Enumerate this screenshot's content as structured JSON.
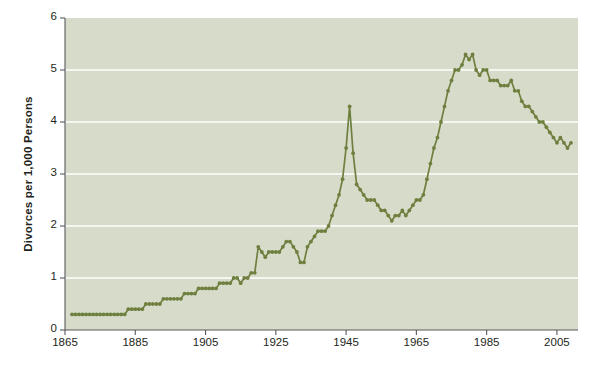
{
  "chart_data": {
    "type": "line",
    "title": "",
    "subtitle": "",
    "xlabel": "",
    "ylabel": "Divorces per 1,000 Persons",
    "xlim": [
      1865,
      2011
    ],
    "ylim": [
      0,
      6
    ],
    "xticks": [
      1865,
      1885,
      1905,
      1925,
      1945,
      1965,
      1985,
      2005
    ],
    "yticks": [
      0,
      1,
      2,
      3,
      4,
      5,
      6
    ],
    "grid": "horizontal",
    "legend": "none",
    "marker": "circle",
    "line_color": "#6f7f3f",
    "marker_color": "#6f7f3f",
    "plot_background": "#d6dcc9",
    "grid_color": "#ffffff",
    "figure_background": "#ffffff",
    "axis_color": "#58595b",
    "text_color": "#231f20",
    "annotations": [],
    "series": [
      {
        "name": "Divorces per 1,000 Persons",
        "x": [
          1867,
          1868,
          1869,
          1870,
          1871,
          1872,
          1873,
          1874,
          1875,
          1876,
          1877,
          1878,
          1879,
          1880,
          1881,
          1882,
          1883,
          1884,
          1885,
          1886,
          1887,
          1888,
          1889,
          1890,
          1891,
          1892,
          1893,
          1894,
          1895,
          1896,
          1897,
          1898,
          1899,
          1900,
          1901,
          1902,
          1903,
          1904,
          1905,
          1906,
          1907,
          1908,
          1909,
          1910,
          1911,
          1912,
          1913,
          1914,
          1915,
          1916,
          1917,
          1918,
          1919,
          1920,
          1921,
          1922,
          1923,
          1924,
          1925,
          1926,
          1927,
          1928,
          1929,
          1930,
          1931,
          1932,
          1933,
          1934,
          1935,
          1936,
          1937,
          1938,
          1939,
          1940,
          1941,
          1942,
          1943,
          1944,
          1945,
          1946,
          1947,
          1948,
          1949,
          1950,
          1951,
          1952,
          1953,
          1954,
          1955,
          1956,
          1957,
          1958,
          1959,
          1960,
          1961,
          1962,
          1963,
          1964,
          1965,
          1966,
          1967,
          1968,
          1969,
          1970,
          1971,
          1972,
          1973,
          1974,
          1975,
          1976,
          1977,
          1978,
          1979,
          1980,
          1981,
          1982,
          1983,
          1984,
          1985,
          1986,
          1987,
          1988,
          1989,
          1990,
          1991,
          1992,
          1993,
          1994,
          1995,
          1996,
          1997,
          1998,
          1999,
          2000,
          2001,
          2002,
          2003,
          2004,
          2005,
          2006,
          2007,
          2008,
          2009
        ],
        "y": [
          0.3,
          0.3,
          0.3,
          0.3,
          0.3,
          0.3,
          0.3,
          0.3,
          0.3,
          0.3,
          0.3,
          0.3,
          0.3,
          0.3,
          0.3,
          0.3,
          0.4,
          0.4,
          0.4,
          0.4,
          0.4,
          0.5,
          0.5,
          0.5,
          0.5,
          0.5,
          0.6,
          0.6,
          0.6,
          0.6,
          0.6,
          0.6,
          0.7,
          0.7,
          0.7,
          0.7,
          0.8,
          0.8,
          0.8,
          0.8,
          0.8,
          0.8,
          0.9,
          0.9,
          0.9,
          0.9,
          1.0,
          1.0,
          0.9,
          1.0,
          1.0,
          1.1,
          1.1,
          1.6,
          1.5,
          1.4,
          1.5,
          1.5,
          1.5,
          1.5,
          1.6,
          1.7,
          1.7,
          1.6,
          1.5,
          1.3,
          1.3,
          1.6,
          1.7,
          1.8,
          1.9,
          1.9,
          1.9,
          2.0,
          2.2,
          2.4,
          2.6,
          2.9,
          3.5,
          4.3,
          3.4,
          2.8,
          2.7,
          2.6,
          2.5,
          2.5,
          2.5,
          2.4,
          2.3,
          2.3,
          2.2,
          2.1,
          2.2,
          2.2,
          2.3,
          2.2,
          2.3,
          2.4,
          2.5,
          2.5,
          2.6,
          2.9,
          3.2,
          3.5,
          3.7,
          4.0,
          4.3,
          4.6,
          4.8,
          5.0,
          5.0,
          5.1,
          5.3,
          5.2,
          5.3,
          5.0,
          4.9,
          5.0,
          5.0,
          4.8,
          4.8,
          4.8,
          4.7,
          4.7,
          4.7,
          4.8,
          4.6,
          4.6,
          4.4,
          4.3,
          4.3,
          4.2,
          4.1,
          4.0,
          4.0,
          3.9,
          3.8,
          3.7,
          3.6,
          3.7,
          3.6,
          3.5,
          3.6
        ]
      }
    ]
  },
  "axis": {
    "y_label_text": "Divorces per 1,000 Persons"
  }
}
